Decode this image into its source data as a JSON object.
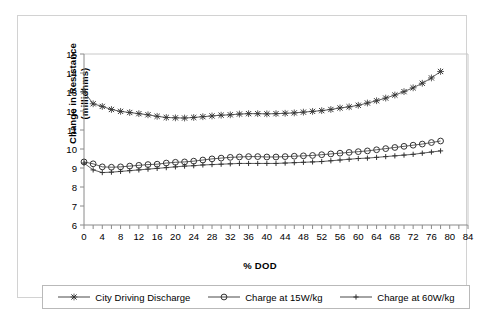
{
  "chart_data": {
    "type": "line",
    "title": "",
    "xlabel": "% DOD",
    "ylabel": "Change in Resistance (milliohms)",
    "ylabel_line1": "Change in Resistance",
    "ylabel_line2": "(milliohms)",
    "xlim": [
      0,
      84
    ],
    "ylim": [
      6,
      15
    ],
    "xticks": [
      0,
      4,
      8,
      12,
      16,
      20,
      24,
      28,
      32,
      36,
      40,
      44,
      48,
      52,
      56,
      60,
      64,
      68,
      72,
      76,
      80,
      84
    ],
    "yticks": [
      6,
      7,
      8,
      9,
      10,
      11,
      12,
      13,
      14,
      15
    ],
    "grid": false,
    "legend_position": "bottom",
    "x": [
      0,
      2,
      4,
      6,
      8,
      10,
      12,
      14,
      16,
      18,
      20,
      22,
      24,
      26,
      28,
      30,
      32,
      34,
      36,
      38,
      40,
      42,
      44,
      46,
      48,
      50,
      52,
      54,
      56,
      58,
      60,
      62,
      64,
      66,
      68,
      70,
      72,
      74,
      76,
      78
    ],
    "series": [
      {
        "name": "City Driving Discharge",
        "marker": "x",
        "color": "#333333",
        "values": [
          13.02,
          12.38,
          12.24,
          12.08,
          11.98,
          11.92,
          11.86,
          11.8,
          11.72,
          11.66,
          11.64,
          11.63,
          11.66,
          11.7,
          11.74,
          11.78,
          11.8,
          11.84,
          11.86,
          11.86,
          11.85,
          11.86,
          11.88,
          11.9,
          11.94,
          11.98,
          12.02,
          12.08,
          12.16,
          12.22,
          12.3,
          12.42,
          12.54,
          12.68,
          12.84,
          13.02,
          13.22,
          13.46,
          13.74,
          14.08
        ]
      },
      {
        "name": "Charge at 15W/kg",
        "marker": "o",
        "color": "#333333",
        "values": [
          9.32,
          9.22,
          9.06,
          9.04,
          9.06,
          9.1,
          9.14,
          9.18,
          9.2,
          9.26,
          9.3,
          9.32,
          9.36,
          9.42,
          9.48,
          9.52,
          9.56,
          9.58,
          9.6,
          9.6,
          9.58,
          9.58,
          9.6,
          9.62,
          9.64,
          9.66,
          9.7,
          9.74,
          9.78,
          9.82,
          9.86,
          9.9,
          9.96,
          10.02,
          10.08,
          10.14,
          10.2,
          10.26,
          10.34,
          10.42
        ]
      },
      {
        "name": "Charge at 60W/kg",
        "marker": "+",
        "color": "#333333",
        "values": [
          9.26,
          8.9,
          8.76,
          8.78,
          8.82,
          8.86,
          8.9,
          8.94,
          8.98,
          9.02,
          9.06,
          9.1,
          9.12,
          9.16,
          9.18,
          9.2,
          9.22,
          9.24,
          9.24,
          9.24,
          9.24,
          9.24,
          9.26,
          9.28,
          9.3,
          9.32,
          9.34,
          9.38,
          9.42,
          9.46,
          9.5,
          9.52,
          9.56,
          9.6,
          9.64,
          9.68,
          9.72,
          9.78,
          9.84,
          9.9
        ]
      }
    ]
  },
  "legend": {
    "items": [
      {
        "label": "City Driving Discharge",
        "marker": "x"
      },
      {
        "label": "Charge at 15W/kg",
        "marker": "o"
      },
      {
        "label": "Charge at 60W/kg",
        "marker": "+"
      }
    ]
  }
}
